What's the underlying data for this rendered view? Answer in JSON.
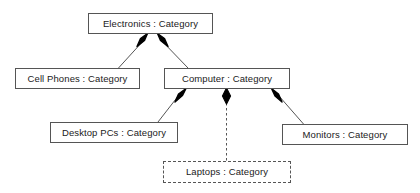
{
  "diagram": {
    "type": "uml-object-composition-diagram",
    "background_color": "#ffffff",
    "line_color": "#555555",
    "diamond_color": "#000000",
    "text_color": "#1a1a1a",
    "nodes": [
      {
        "id": "electronics",
        "label": "Electronics : Category",
        "border": "solid"
      },
      {
        "id": "cellphones",
        "label": "Cell Phones : Category",
        "border": "solid"
      },
      {
        "id": "computer",
        "label": "Computer : Category",
        "border": "solid"
      },
      {
        "id": "desktoppcs",
        "label": "Desktop PCs : Category",
        "border": "solid"
      },
      {
        "id": "monitors",
        "label": "Monitors : Category",
        "border": "solid"
      },
      {
        "id": "laptops",
        "label": "Laptops : Category",
        "border": "dashed"
      }
    ],
    "edges": [
      {
        "from": "electronics",
        "to": "cellphones",
        "connector": "filled-diamond",
        "line": "solid"
      },
      {
        "from": "electronics",
        "to": "computer",
        "connector": "filled-diamond",
        "line": "solid"
      },
      {
        "from": "computer",
        "to": "desktoppcs",
        "connector": "filled-diamond",
        "line": "solid"
      },
      {
        "from": "computer",
        "to": "laptops",
        "connector": "filled-diamond",
        "line": "dashed"
      },
      {
        "from": "computer",
        "to": "monitors",
        "connector": "filled-diamond",
        "line": "solid"
      }
    ]
  }
}
